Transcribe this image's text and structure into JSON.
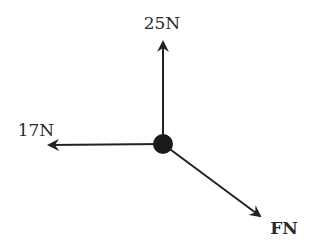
{
  "diagram": {
    "type": "free-body force diagram",
    "center": {
      "x": 163,
      "y": 144,
      "radius": 9
    },
    "colors": {
      "line": "#222222",
      "text": "#2a2a2a",
      "background": "#ffffff"
    },
    "forces": [
      {
        "id": "up",
        "label": "25N",
        "value": "25 N",
        "direction": "up",
        "tip": {
          "x": 163,
          "y": 40
        },
        "label_pos": {
          "x": 162,
          "y": 29
        }
      },
      {
        "id": "left",
        "label": "17N",
        "value": "17 N",
        "direction": "left",
        "tip": {
          "x": 47,
          "y": 145
        },
        "label_pos": {
          "x": 36,
          "y": 136
        }
      },
      {
        "id": "down-right",
        "label": "FN",
        "value": "F N",
        "direction": "down-right",
        "tip": {
          "x": 262,
          "y": 218
        },
        "label_pos": {
          "x": 284,
          "y": 234
        }
      }
    ]
  }
}
